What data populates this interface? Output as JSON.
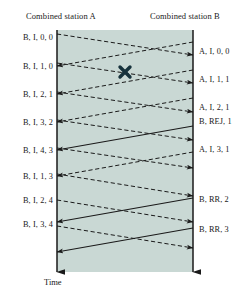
{
  "diagram": {
    "title_left": "Combined station A",
    "title_right": "Combined station B",
    "time_axis_label": "Time",
    "colors": {
      "shade_fill": "#c9d8d4",
      "line": "#1a1a1a",
      "text": "#1a1a1a",
      "error_marker": "#16323c"
    },
    "left_labels": [
      {
        "text": "B, I, 0, 0",
        "top": 33
      },
      {
        "text": "B, I, 1, 0",
        "top": 62
      },
      {
        "text": "B, I, 2, 1",
        "top": 90
      },
      {
        "text": "B, I, 3, 2",
        "top": 118
      },
      {
        "text": "B, I, 4, 3",
        "top": 146
      },
      {
        "text": "B, I, 1, 3",
        "top": 172
      },
      {
        "text": "B, I, 2, 4",
        "top": 196
      },
      {
        "text": "B, I, 3, 4",
        "top": 220
      }
    ],
    "right_labels": [
      {
        "text": "A, I, 0, 0",
        "top": 47
      },
      {
        "text": "A, I, 1, 1",
        "top": 75
      },
      {
        "text": "A, I, 2, 1",
        "top": 103
      },
      {
        "text": "B, REJ, 1",
        "top": 117
      },
      {
        "text": "A, I, 3, 1",
        "top": 145
      },
      {
        "text": "B, RR, 2",
        "top": 195
      },
      {
        "text": "B, RR, 3",
        "top": 225
      }
    ],
    "error_marker": {
      "x": 125,
      "y": 72,
      "symbol": "x"
    },
    "station_a_axis": {
      "x": 57,
      "y_top": 30,
      "y_bottom": 272
    },
    "station_b_axis": {
      "x": 193,
      "y_top": 30,
      "y_bottom": 272
    },
    "messages": [
      {
        "from": "A",
        "style": "dashed",
        "x1": 57,
        "y1": 34,
        "x2": 193,
        "y2": 55,
        "arrow": true
      },
      {
        "from": "B",
        "style": "dashed",
        "x1": 193,
        "y1": 42,
        "x2": 57,
        "y2": 66,
        "arrow": true
      },
      {
        "from": "A",
        "style": "dashed",
        "x1": 57,
        "y1": 63,
        "x2": 193,
        "y2": 83,
        "arrow": true
      },
      {
        "from": "B",
        "style": "dashed",
        "x1": 193,
        "y1": 70,
        "x2": 57,
        "y2": 94,
        "arrow": true
      },
      {
        "from": "A",
        "style": "dashed",
        "x1": 57,
        "y1": 92,
        "x2": 193,
        "y2": 112,
        "arrow": true
      },
      {
        "from": "B",
        "style": "dashed",
        "x1": 193,
        "y1": 98,
        "x2": 57,
        "y2": 122,
        "arrow": true
      },
      {
        "from": "A",
        "style": "dashed",
        "x1": 57,
        "y1": 120,
        "x2": 193,
        "y2": 140,
        "arrow": true
      },
      {
        "from": "B",
        "style": "solid",
        "x1": 193,
        "y1": 126,
        "x2": 57,
        "y2": 150,
        "arrow": true
      },
      {
        "from": "A",
        "style": "dashed",
        "x1": 57,
        "y1": 148,
        "x2": 193,
        "y2": 168,
        "arrow": true
      },
      {
        "from": "B",
        "style": "dashed",
        "x1": 193,
        "y1": 152,
        "x2": 57,
        "y2": 176,
        "arrow": true
      },
      {
        "from": "A",
        "style": "dashed",
        "x1": 57,
        "y1": 174,
        "x2": 193,
        "y2": 196,
        "arrow": true
      },
      {
        "from": "B",
        "style": "solid",
        "x1": 193,
        "y1": 198,
        "x2": 57,
        "y2": 222,
        "arrow": true
      },
      {
        "from": "A",
        "style": "dashed",
        "x1": 57,
        "y1": 200,
        "x2": 193,
        "y2": 222,
        "arrow": true
      },
      {
        "from": "B",
        "style": "solid",
        "x1": 193,
        "y1": 228,
        "x2": 57,
        "y2": 252,
        "arrow": true
      },
      {
        "from": "A",
        "style": "dashed",
        "x1": 57,
        "y1": 226,
        "x2": 193,
        "y2": 248,
        "arrow": true
      }
    ]
  }
}
